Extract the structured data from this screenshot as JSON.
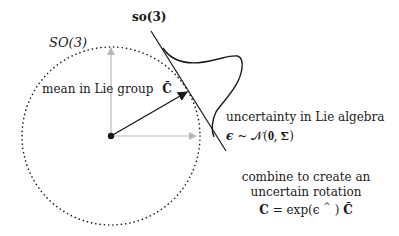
{
  "labels": {
    "lie_group": "SO(3)",
    "lie_algebra": "so(3)",
    "mean": "mean in Lie group",
    "mean_symbol": "C̄",
    "uncertainty_title": "uncertainty in Lie algebra",
    "uncertainty_eq_eps": "ϵ",
    "uncertainty_eq_rest": " ~ 𝒩(𝟎, 𝚺)",
    "combine_line1": "combine to create an",
    "combine_line2": "uncertain rotation",
    "combine_eq_lhs": "C",
    "combine_eq_mid": " = exp(ϵ",
    "combine_eq_sup": "^",
    "combine_eq_rhs": ")",
    "combine_eq_end": "C̄"
  },
  "colors": {
    "ink": "#1a1a1a",
    "axis_gray": "#b8b8b8"
  }
}
